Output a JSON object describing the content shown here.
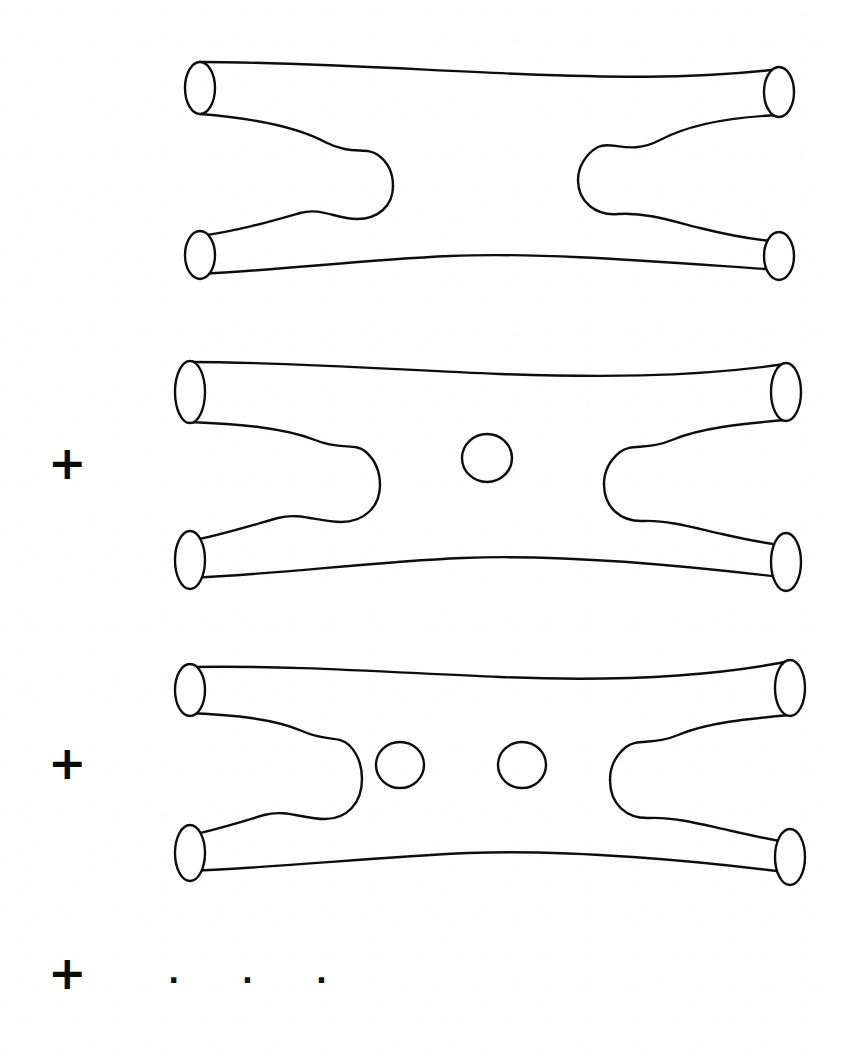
{
  "figure": {
    "background_color": "#ffffff",
    "ink_color": "#0d0d0d",
    "stroke_width": 2.4
  },
  "operators": [
    {
      "id": "plus-1",
      "symbol": "+",
      "x": 48,
      "y": 440,
      "size": 46
    },
    {
      "id": "plus-2",
      "symbol": "+",
      "x": 48,
      "y": 740,
      "size": 46
    },
    {
      "id": "plus-3",
      "symbol": "+",
      "x": 48,
      "y": 950,
      "size": 46
    }
  ],
  "ellipsis": {
    "symbol": "· · ·",
    "x": 168,
    "y": 972,
    "size": 30
  },
  "panels": [
    {
      "id": "worldsheet-genus-0",
      "label": "genus 0 worldsheet",
      "genus": 0,
      "holes": [],
      "external_legs": 4,
      "top": 40,
      "height": 270
    },
    {
      "id": "worldsheet-genus-1",
      "label": "genus 1 worldsheet",
      "genus": 1,
      "holes": [
        {
          "cx": 487,
          "cy": 458,
          "rx": 25,
          "ry": 24
        }
      ],
      "external_legs": 4,
      "top": 340,
      "height": 270
    },
    {
      "id": "worldsheet-genus-2",
      "label": "genus 2 worldsheet",
      "genus": 2,
      "holes": [
        {
          "cx": 400,
          "cy": 765,
          "rx": 24,
          "ry": 23
        },
        {
          "cx": 522,
          "cy": 765,
          "rx": 24,
          "ry": 23
        }
      ],
      "external_legs": 4,
      "top": 645,
      "height": 270
    }
  ],
  "geometry": {
    "left_cap_x": 200,
    "right_cap_x": 780,
    "cap_rx": 15,
    "cap_ry": 26,
    "upper_cap_y": 88,
    "lower_cap_y": 248,
    "crotch_left_x": 388,
    "crotch_right_x": 592
  }
}
